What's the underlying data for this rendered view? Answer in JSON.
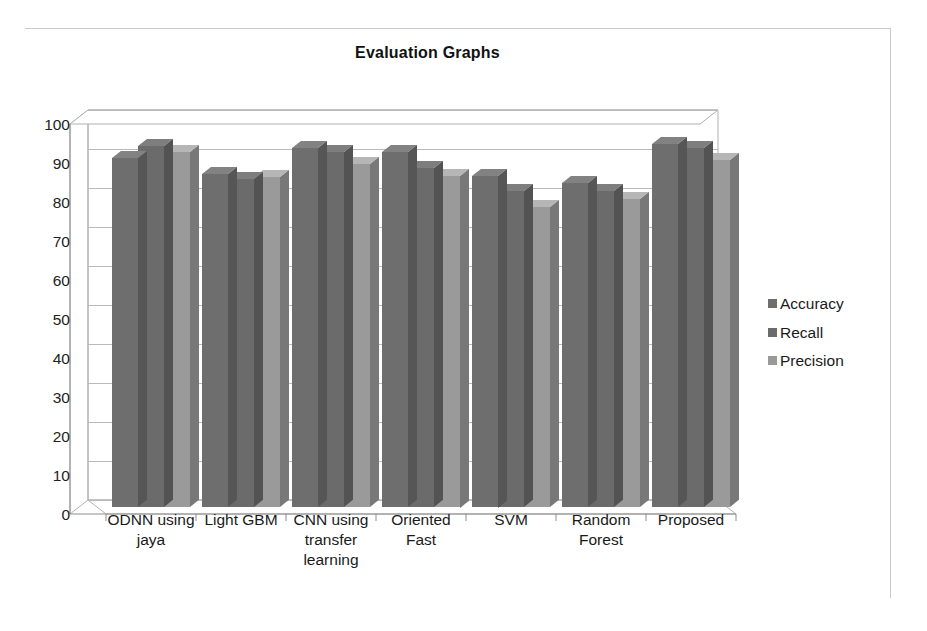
{
  "chart_data": {
    "type": "bar",
    "title": "Evaluation Graphs",
    "xlabel": "",
    "ylabel": "",
    "ylim": [
      0,
      100
    ],
    "ytick_step": 10,
    "yticks": [
      100,
      90,
      80,
      70,
      60,
      50,
      40,
      30,
      20,
      10,
      0
    ],
    "grid": true,
    "legend_position": "right",
    "style": "3d-clustered-column",
    "categories": [
      "ODNN using jaya",
      "Light GBM",
      "CNN using transfer learning",
      "Oriented Fast",
      "SVM",
      "Random Forest",
      "Proposed"
    ],
    "category_lines": [
      [
        "ODNN using",
        "jaya"
      ],
      [
        "Light GBM"
      ],
      [
        "CNN using",
        "transfer",
        "learning"
      ],
      [
        "Oriented",
        "Fast"
      ],
      [
        "SVM"
      ],
      [
        "Random",
        "Forest"
      ],
      [
        "Proposed"
      ]
    ],
    "series": [
      {
        "name": "Accuracy",
        "color": "#6e6e6e",
        "values": [
          89.5,
          85.5,
          92.0,
          91.0,
          85.0,
          83.0,
          93.0
        ]
      },
      {
        "name": "Recall",
        "color": "#6b6b6b",
        "values": [
          92.5,
          84.0,
          91.0,
          87.0,
          81.0,
          81.0,
          92.0
        ]
      },
      {
        "name": "Precision",
        "color": "#9a9a9a",
        "values": [
          91.0,
          84.5,
          88.0,
          85.0,
          77.0,
          79.0,
          89.0
        ]
      }
    ]
  },
  "legend": {
    "items": [
      {
        "label": "Accuracy",
        "color": "#6e6e6e"
      },
      {
        "label": "Recall",
        "color": "#6b6b6b"
      },
      {
        "label": "Precision",
        "color": "#9a9a9a"
      }
    ]
  }
}
